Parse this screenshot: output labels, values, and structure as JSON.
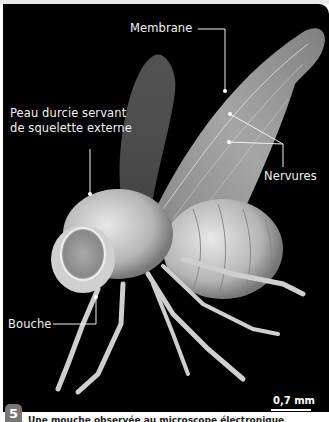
{
  "figure": {
    "number": "5",
    "caption": "Une mouche observée au microscope électronique",
    "scale": "0,7 mm",
    "labels": {
      "membrane": "Membrane",
      "skeleton_line1": "Peau durcie servant",
      "skeleton_line2": "de squelette externe",
      "veins": "Nervures",
      "mouth": "Bouche"
    },
    "colors": {
      "background": "#000000",
      "label_text": "#f2f2f2",
      "badge": "#777777"
    }
  }
}
